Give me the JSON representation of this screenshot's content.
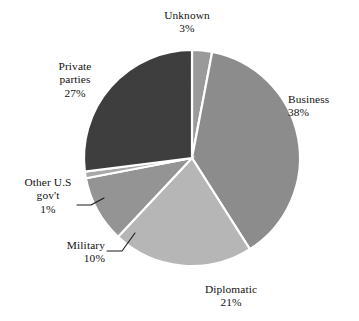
{
  "chart_data": {
    "type": "pie",
    "title": "",
    "subtitle": "",
    "xlabel": "",
    "ylabel": "",
    "legend_position": "none",
    "grid": false,
    "value_unit": "percent",
    "labels_show_percent": true,
    "categories": [
      "Unknown",
      "Business",
      "Diplomatic",
      "Military",
      "Other U.S gov't",
      "Private parties"
    ],
    "values": [
      3,
      38,
      21,
      10,
      1,
      27
    ],
    "slices": [
      {
        "name": "Unknown",
        "label_line1": "Unknown",
        "label_line2": "",
        "value": 3,
        "percent_text": "3%",
        "color": "#9a9a9a",
        "start_angle": 0,
        "end_angle": 10.8,
        "label_placement": "top",
        "has_leader_line": false
      },
      {
        "name": "Business",
        "label_line1": "Business",
        "label_line2": "",
        "value": 38,
        "percent_text": "38%",
        "color": "#8c8c8c",
        "start_angle": 10.8,
        "end_angle": 147.6,
        "label_placement": "right",
        "has_leader_line": false
      },
      {
        "name": "Diplomatic",
        "label_line1": "Diplomatic",
        "label_line2": "",
        "value": 21,
        "percent_text": "21%",
        "color": "#b6b6b6",
        "start_angle": 147.6,
        "end_angle": 223.2,
        "label_placement": "bottom",
        "has_leader_line": false
      },
      {
        "name": "Military",
        "label_line1": "Military",
        "label_line2": "",
        "value": 10,
        "percent_text": "10%",
        "color": "#949494",
        "start_angle": 223.2,
        "end_angle": 259.2,
        "label_placement": "left-bottom",
        "has_leader_line": true
      },
      {
        "name": "Other U.S gov't",
        "label_line1": "Other U.S",
        "label_line2": "gov't",
        "value": 1,
        "percent_text": "1%",
        "color": "#a8a8a8",
        "start_angle": 259.2,
        "end_angle": 262.8,
        "label_placement": "left",
        "has_leader_line": true
      },
      {
        "name": "Private parties",
        "label_line1": "Private",
        "label_line2": "parties",
        "value": 27,
        "percent_text": "27%",
        "color": "#3e3e3e",
        "start_angle": 262.8,
        "end_angle": 360,
        "label_placement": "left-top",
        "has_leader_line": false
      }
    ],
    "geometry": {
      "center_x": 192,
      "center_y": 158,
      "radius": 108,
      "separator_color": "#ffffff"
    },
    "background_color": "#ffffff",
    "text_color": "#111111"
  }
}
